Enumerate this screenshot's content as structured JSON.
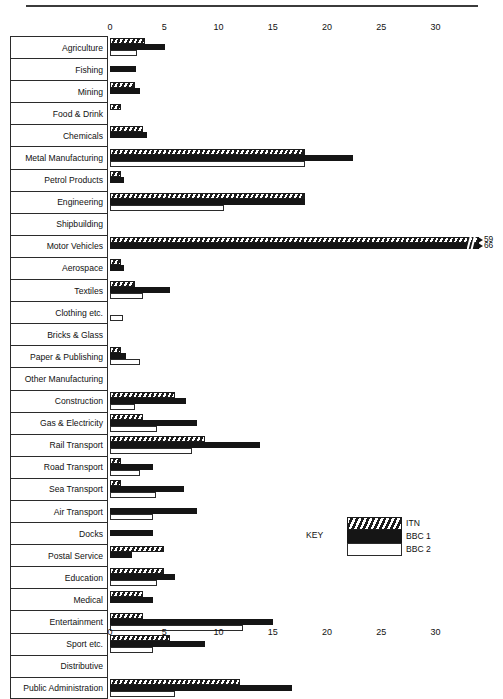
{
  "chart_data": {
    "type": "bar",
    "orientation": "horizontal",
    "title": "",
    "xlabel": "",
    "ylabel": "",
    "xlim": [
      0,
      34
    ],
    "xticks": [
      0,
      5,
      10,
      15,
      20,
      25,
      30
    ],
    "xtick_labels": [
      "0",
      "5",
      "10",
      "15",
      "20",
      "25",
      "30"
    ],
    "grid": false,
    "legend_position": "inside-right",
    "legend_title": "KEY",
    "categories": [
      "Agriculture",
      "Fishing",
      "Mining",
      "Food & Drink",
      "Chemicals",
      "Metal Manufacturing",
      "Petrol Products",
      "Engineering",
      "Shipbuilding",
      "Motor Vehicles",
      "Aerospace",
      "Textiles",
      "Clothing etc.",
      "Bricks & Glass",
      "Paper & Publishing",
      "Other Manufacturing",
      "Construction",
      "Gas & Electricity",
      "Rail Transport",
      "Road Transport",
      "Sea Transport",
      "Air Transport",
      "Docks",
      "Postal Service",
      "Education",
      "Medical",
      "Entertainment",
      "Sport etc.",
      "Distributive",
      "Public Administration"
    ],
    "series": [
      {
        "name": "ITN",
        "pattern": "diagonal-hatch",
        "values": [
          3.2,
          0,
          2.3,
          1.0,
          3.0,
          18.0,
          1.0,
          18.0,
          0,
          59,
          1.0,
          2.3,
          0,
          0,
          1.0,
          0,
          6.0,
          3.0,
          8.8,
          1.0,
          1.0,
          0,
          0,
          5.0,
          5.0,
          3.0,
          3.0,
          5.5,
          0,
          12.0
        ]
      },
      {
        "name": "BBC 1",
        "pattern": "solid-black",
        "values": [
          5.1,
          2.4,
          2.8,
          0,
          3.4,
          22.4,
          1.3,
          18.0,
          0,
          66,
          1.3,
          5.5,
          0,
          0,
          1.5,
          0,
          7.0,
          8.0,
          13.8,
          4.0,
          6.8,
          8.0,
          4.0,
          2.0,
          6.0,
          4.0,
          15.0,
          8.8,
          0,
          16.8
        ]
      },
      {
        "name": "BBC 2",
        "pattern": "white-outline",
        "values": [
          2.5,
          0,
          0,
          0,
          0,
          18.0,
          0,
          10.5,
          0,
          0,
          0,
          3.0,
          1.2,
          0,
          2.8,
          0,
          2.3,
          4.3,
          7.6,
          2.8,
          4.2,
          4.0,
          0,
          0,
          4.3,
          0,
          12.3,
          4.0,
          0,
          6.0
        ]
      }
    ],
    "annotations": [
      {
        "category": "Motor Vehicles",
        "series": "ITN",
        "label": "59",
        "axis_break": true
      },
      {
        "category": "Motor Vehicles",
        "series": "BBC 1",
        "label": "66",
        "axis_break": true
      }
    ]
  },
  "legend": {
    "title": "KEY",
    "entries": [
      {
        "label": "ITN",
        "style": "diagonal-hatch"
      },
      {
        "label": "BBC 1",
        "style": "solid-black"
      },
      {
        "label": "BBC 2",
        "style": "white-outline"
      }
    ]
  },
  "colors": {
    "bar_dark": "#151515",
    "hatch_dark": "#1c1c1c",
    "outline": "#2b2b2b",
    "background": "#ffffff",
    "text": "#111111"
  }
}
